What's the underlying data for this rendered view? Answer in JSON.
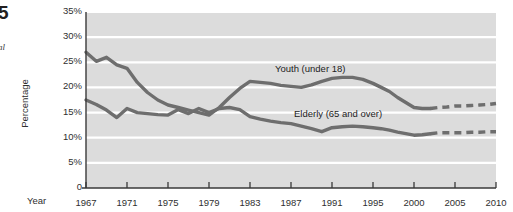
{
  "margin": {
    "badge": "5",
    "caption": "al"
  },
  "chart_data": {
    "type": "line",
    "title": "",
    "xlabel": "Year",
    "ylabel": "Percentage",
    "grid": true,
    "legend_position": "inline-annotations",
    "xlim": [
      1967,
      2010
    ],
    "ylim": [
      0,
      35
    ],
    "ytick_labels": [
      "35%",
      "30%",
      "25%",
      "20%",
      "15%",
      "10%",
      "5%",
      "0"
    ],
    "ytick_values": [
      35,
      30,
      25,
      20,
      15,
      10,
      5,
      0
    ],
    "xtick_labels": [
      "1967",
      "1971",
      "1975",
      "1979",
      "1983",
      "1987",
      "1991",
      "1995",
      "2000",
      "2005",
      "2010"
    ],
    "xtick_values": [
      1967,
      1971,
      1975,
      1979,
      1983,
      1987,
      1991,
      1995,
      2000,
      2005,
      2010
    ],
    "annotations": [
      {
        "text": "Youth (under 18)",
        "x": 1991,
        "y": 22.5
      },
      {
        "text": "Elderly (65 and over)",
        "x": 1993,
        "y": 14.5
      }
    ],
    "series": [
      {
        "name": "Youth (under 18)",
        "color": "#6e6e6e",
        "style": "solid-then-dashed",
        "dash_starts": 2002,
        "x": [
          1967,
          1968,
          1969,
          1970,
          1971,
          1972,
          1973,
          1974,
          1975,
          1976,
          1977,
          1978,
          1979,
          1980,
          1981,
          1982,
          1983,
          1984,
          1985,
          1986,
          1987,
          1988,
          1989,
          1990,
          1991,
          1992,
          1993,
          1994,
          1995,
          1996,
          1997,
          1998,
          1999,
          2000,
          2001,
          2002,
          2003,
          2004,
          2005,
          2006,
          2007,
          2008,
          2009,
          2010
        ],
        "y": [
          27.0,
          25.2,
          26.0,
          24.5,
          23.8,
          21.0,
          19.0,
          17.5,
          16.5,
          16.0,
          15.5,
          15.0,
          14.5,
          16.0,
          18.0,
          19.8,
          21.2,
          21.0,
          20.8,
          20.4,
          20.2,
          20.0,
          20.5,
          21.2,
          21.8,
          22.0,
          22.0,
          21.6,
          20.8,
          20.0,
          19.2,
          18.0,
          17.0,
          16.0,
          15.8,
          15.8,
          16.0,
          16.1,
          16.3,
          16.3,
          16.4,
          16.5,
          16.6,
          16.8
        ]
      },
      {
        "name": "Elderly (65 and over)",
        "color": "#6e6e6e",
        "style": "solid-then-dashed",
        "dash_starts": 2002,
        "x": [
          1967,
          1968,
          1969,
          1970,
          1971,
          1972,
          1973,
          1974,
          1975,
          1976,
          1977,
          1978,
          1979,
          1980,
          1981,
          1982,
          1983,
          1984,
          1985,
          1986,
          1987,
          1988,
          1989,
          1990,
          1991,
          1992,
          1993,
          1994,
          1995,
          1996,
          1997,
          1998,
          1999,
          2000,
          2001,
          2002,
          2003,
          2004,
          2005,
          2006,
          2007,
          2008,
          2009,
          2010
        ],
        "y": [
          17.5,
          16.6,
          15.5,
          14.0,
          15.8,
          15.0,
          14.8,
          14.6,
          14.5,
          15.6,
          14.8,
          15.8,
          15.0,
          15.8,
          16.0,
          15.6,
          14.2,
          13.7,
          13.3,
          13.0,
          12.8,
          12.3,
          11.8,
          11.2,
          12.0,
          12.2,
          12.3,
          12.2,
          12.0,
          11.8,
          11.5,
          11.1,
          10.8,
          10.5,
          10.6,
          10.8,
          11.0,
          11.0,
          11.0,
          11.0,
          11.1,
          11.1,
          11.2,
          11.2
        ]
      }
    ]
  }
}
